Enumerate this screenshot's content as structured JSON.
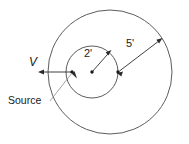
{
  "figure": {
    "kind": "engineering-sketch",
    "background_color": "#ffffff",
    "line_color": "#4a4a4a",
    "dimension_color": "#2b2b2b",
    "leader_color": "#8d8d8d"
  },
  "labels": {
    "inner_radius": "2'",
    "outer_radius": "5'",
    "velocity": "V",
    "source": "Source"
  },
  "geometry": {
    "outer_circle": {
      "cx": 110,
      "cy": 72,
      "r": 62
    },
    "inner_circle": {
      "cx": 92,
      "cy": 72,
      "r": 26
    },
    "source_point": {
      "x": 72,
      "y": 72
    },
    "inner_center_point": {
      "x": 92,
      "y": 72
    },
    "inner_right_point": {
      "x": 118,
      "y": 72
    }
  }
}
